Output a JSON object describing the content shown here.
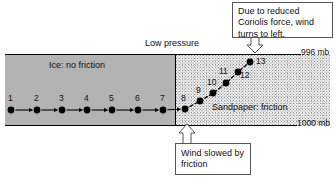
{
  "figure": {
    "title_text": "",
    "low_pressure_label": "Low pressure",
    "ice_region_label": "Ice:  no friction",
    "sandpaper_region_label": "Sandpaper:  friction",
    "isobar_top_label": "996 mb",
    "isobar_bottom_label": "1000 mb",
    "callout_coriolis": "Due to reduced Coriolis force, wind turns to left.",
    "callout_friction": "Wind slowed by friction",
    "colors": {
      "ice_fill": "#b3b3b3",
      "sandpaper_fill": "#f2f2f2",
      "line": "#000000",
      "text": "#111111",
      "callout_border": "#555555"
    }
  },
  "chart_data": {
    "type": "scatter",
    "xlabel": "",
    "ylabel": "",
    "xlim": [
      0,
      336
    ],
    "ylim": [
      178,
      0
    ],
    "grid": false,
    "legend": "none",
    "annotations": [
      "Low pressure",
      "Ice:  no friction",
      "Sandpaper:  friction",
      "996 mb",
      "1000 mb",
      "Due to reduced Coriolis force, wind turns to left.",
      "Wind slowed by friction"
    ],
    "series": [
      {
        "name": "Ice segment (no friction, straight path)",
        "labels": [
          "1",
          "2",
          "3",
          "4",
          "5",
          "6",
          "7"
        ],
        "x": [
          11,
          37,
          62,
          87,
          112,
          138,
          163
        ],
        "y": [
          110,
          110,
          110,
          110,
          110,
          110,
          110
        ]
      },
      {
        "name": "Sandpaper segment (friction, curving path)",
        "labels": [
          "8",
          "9",
          "10",
          "11",
          "12",
          "13"
        ],
        "x": [
          185,
          200,
          213,
          226,
          238,
          250
        ],
        "y": [
          109,
          101,
          93,
          83,
          72,
          62
        ]
      }
    ]
  },
  "points": [
    {
      "label": "1",
      "x": 11,
      "y": 110,
      "label_x": 8,
      "label_y": 93,
      "segment": "ice"
    },
    {
      "label": "2",
      "x": 37,
      "y": 110,
      "label_x": 34,
      "label_y": 93,
      "segment": "ice"
    },
    {
      "label": "3",
      "x": 62,
      "y": 110,
      "label_x": 59,
      "label_y": 93,
      "segment": "ice"
    },
    {
      "label": "4",
      "x": 87,
      "y": 110,
      "label_x": 84,
      "label_y": 93,
      "segment": "ice"
    },
    {
      "label": "5",
      "x": 112,
      "y": 110,
      "label_x": 109,
      "label_y": 93,
      "segment": "ice"
    },
    {
      "label": "6",
      "x": 138,
      "y": 110,
      "label_x": 135,
      "label_y": 93,
      "segment": "ice"
    },
    {
      "label": "7",
      "x": 163,
      "y": 110,
      "label_x": 160,
      "label_y": 93,
      "segment": "ice"
    },
    {
      "label": "8",
      "x": 185,
      "y": 109,
      "label_x": 181,
      "label_y": 93,
      "segment": "sandpaper"
    },
    {
      "label": "9",
      "x": 200,
      "y": 101,
      "label_x": 196,
      "label_y": 85,
      "segment": "sandpaper"
    },
    {
      "label": "10",
      "x": 213,
      "y": 93,
      "label_x": 207,
      "label_y": 77,
      "segment": "sandpaper"
    },
    {
      "label": "11",
      "x": 226,
      "y": 83,
      "label_x": 219,
      "label_y": 66,
      "segment": "sandpaper"
    },
    {
      "label": "12",
      "x": 238,
      "y": 72,
      "label_x": 240,
      "label_y": 70,
      "segment": "sandpaper"
    },
    {
      "label": "13",
      "x": 250,
      "y": 62,
      "label_x": 256,
      "label_y": 56,
      "segment": "sandpaper"
    }
  ]
}
